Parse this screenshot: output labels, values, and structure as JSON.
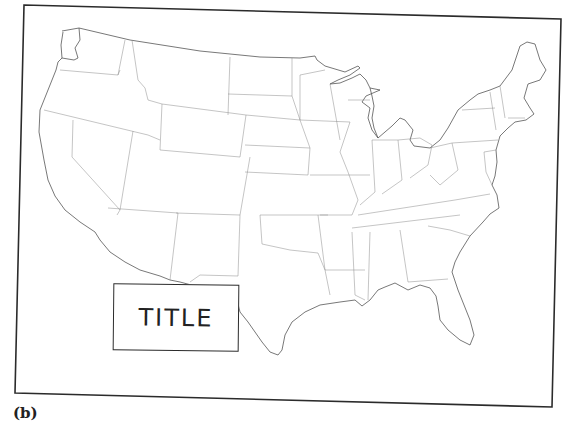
{
  "figure": {
    "type": "outline map",
    "title_box": {
      "label": "TITLE"
    },
    "caption": "(b)"
  },
  "colors": {
    "frame": "#2b2b2b",
    "coastline": "#555555",
    "state_borders": "#8a8a8a",
    "background": "#ffffff"
  }
}
